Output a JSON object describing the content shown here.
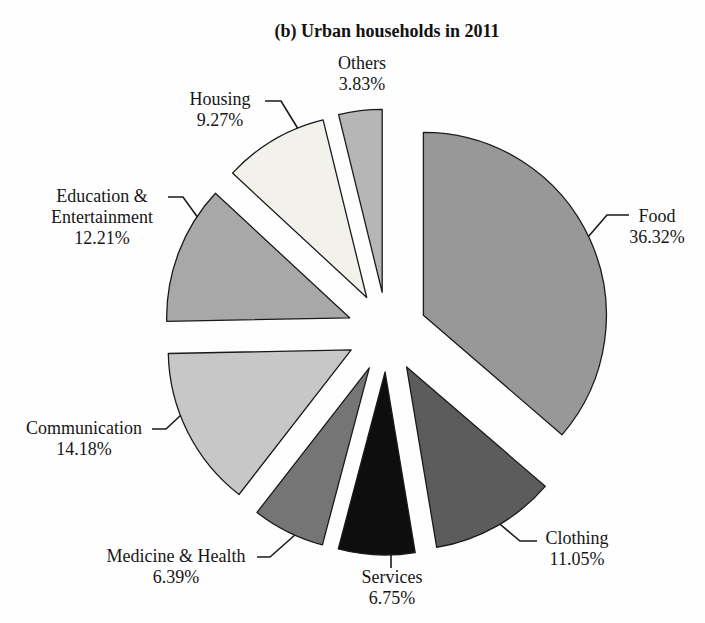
{
  "title": "(b) Urban households in 2011",
  "chart_data": {
    "type": "pie",
    "title": "(b) Urban households in 2011",
    "value_unit": "%",
    "total": 100,
    "direction": "clockwise",
    "start_angle_deg_from_top": 0,
    "categories": [
      "Food",
      "Clothing",
      "Services",
      "Medicine & Health",
      "Communication",
      "Education & Entertainment",
      "Housing",
      "Others"
    ],
    "values": [
      36.32,
      11.05,
      6.75,
      6.39,
      14.18,
      12.21,
      9.27,
      3.83
    ],
    "slices": [
      {
        "label": "Food",
        "value": 36.32,
        "display": "36.32%",
        "color": "#989898",
        "label_lines": [
          "Food",
          "36.32%"
        ],
        "label_x": 657,
        "label_y": 206,
        "leader": [
          [
            629,
            215
          ],
          [
            607,
            215
          ],
          [
            588,
            237
          ]
        ]
      },
      {
        "label": "Clothing",
        "value": 11.05,
        "display": "11.05%",
        "color": "#5c5c5c",
        "label_lines": [
          "Clothing",
          "11.05%"
        ],
        "label_x": 577,
        "label_y": 528,
        "leader": [
          [
            537,
            541
          ],
          [
            520,
            541
          ],
          [
            495,
            520
          ]
        ]
      },
      {
        "label": "Services",
        "value": 6.75,
        "display": "6.75%",
        "color": "#0e0e0e",
        "label_lines": [
          "Services",
          "6.75%"
        ],
        "label_x": 392,
        "label_y": 567,
        "leader": [
          [
            391,
            551
          ],
          [
            391,
            568
          ]
        ]
      },
      {
        "label": "Medicine & Health",
        "value": 6.39,
        "display": "6.39%",
        "color": "#757575",
        "label_lines": [
          "Medicine & Health",
          "6.39%"
        ],
        "label_x": 176,
        "label_y": 546,
        "leader": [
          [
            257,
            557
          ],
          [
            270,
            557
          ],
          [
            296,
            534
          ]
        ]
      },
      {
        "label": "Communication",
        "value": 14.18,
        "display": "14.18%",
        "color": "#c7c7c7",
        "label_lines": [
          "Communication",
          "14.18%"
        ],
        "label_x": 84,
        "label_y": 418,
        "leader": [
          [
            152,
            429
          ],
          [
            166,
            429
          ],
          [
            181,
            415
          ]
        ]
      },
      {
        "label": "Education & Entertainment",
        "value": 12.21,
        "display": "12.21%",
        "color": "#a8a8a8",
        "label_lines": [
          "Education &",
          "Entertainment",
          "12.21%"
        ],
        "label_x": 102,
        "label_y": 186,
        "leader": [
          [
            168,
            197
          ],
          [
            183,
            197
          ],
          [
            201,
            222
          ]
        ]
      },
      {
        "label": "Housing",
        "value": 9.27,
        "display": "9.27%",
        "color": "#f2f1ec",
        "label_lines": [
          "Housing",
          "9.27%"
        ],
        "label_x": 220,
        "label_y": 89,
        "leader": [
          [
            265,
            101
          ],
          [
            281,
            101
          ],
          [
            300,
            132
          ]
        ]
      },
      {
        "label": "Others",
        "value": 3.83,
        "display": "3.83%",
        "color": "#b6b6b6",
        "label_lines": [
          "Others",
          "3.83%"
        ],
        "label_x": 362,
        "label_y": 53,
        "leader": []
      }
    ],
    "layout": {
      "cx": 387,
      "cy": 332,
      "radius": 183,
      "explode_offset": 40,
      "stroke_color": "#1a1a1a",
      "leader_color": "#1a1a1a",
      "legend": "none",
      "labels_position": "outside-with-leader-lines"
    }
  }
}
